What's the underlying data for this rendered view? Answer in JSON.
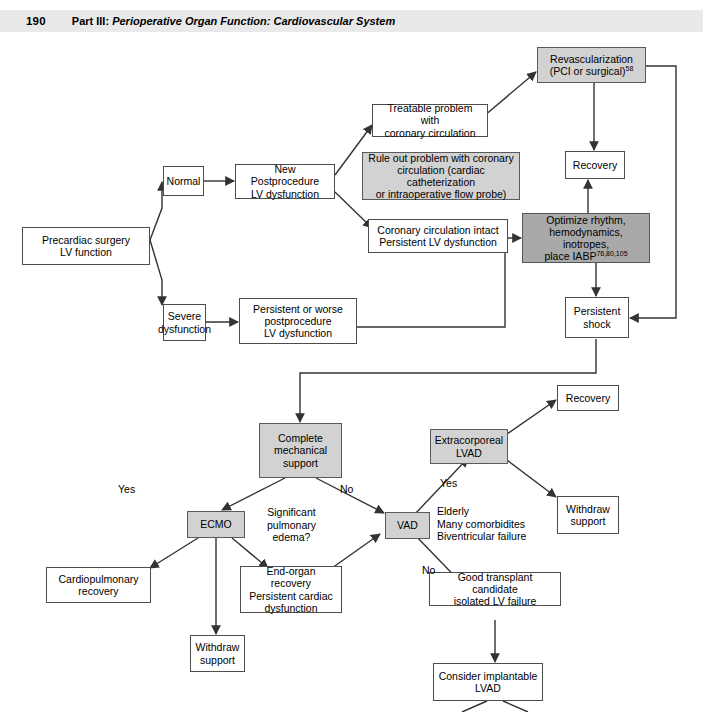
{
  "header": {
    "page_number": "190",
    "part_prefix": "Part III:",
    "part_title": "Perioperative Organ Function: Cardiovascular System"
  },
  "colors": {
    "gray_light_box": "#d2d2d2",
    "gray_dark_box": "#a9a9a9",
    "plain_box": "#ffffff",
    "line": "#333333",
    "header_band": "#e9e9e9"
  },
  "nodes": {
    "precardiac": "Precardiac surgery\nLV function",
    "normal": "Normal",
    "severe_dysfunction": "Severe\ndysfunction",
    "new_postprocedure": "New Postprocedure\nLV dysfunction",
    "treatable_problem": "Treatable problem with\ncoronary circulation",
    "rule_out": "Rule out problem with coronary\ncirculation (cardiac catheterization\nor intraoperative flow probe)",
    "coronary_intact": "Coronary circulation intact\nPersistent LV dysfunction",
    "persistent_worse": "Persistent or worse\npostprocedure\nLV dysfunction",
    "revascularization_line1": "Revascularization",
    "revascularization_line2": "(PCI or surgical)",
    "revascularization_ref": "58",
    "recovery_top": "Recovery",
    "optimize_line1": "Optimize rhythm,",
    "optimize_line2": "hemodynamics, inotropes,",
    "optimize_line3": "place IABP",
    "optimize_ref": "76,80,105",
    "persistent_shock": "Persistent\nshock",
    "complete_mechanical": "Complete\nmechanical\nsupport",
    "ecmo": "ECMO",
    "vad": "VAD",
    "cardiopulmonary_recovery": "Cardiopulmonary\nrecovery",
    "end_organ_recovery": "End-organ recovery\nPersistent cardiac\ndysfunction",
    "withdraw_support_left": "Withdraw\nsupport",
    "extracorporeal_lvad": "Extracorporeal\nLVAD",
    "recovery_right": "Recovery",
    "withdraw_support_right": "Withdraw\nsupport",
    "good_transplant": "Good transplant candidate\nisolated LV failure",
    "consider_implantable": "Consider implantable\nLVAD"
  },
  "labels": {
    "yes_ecmo": "Yes",
    "no_vad": "No",
    "yes_lvad": "Yes",
    "no_transplant": "No",
    "significant_pulmonary_edema": "Significant\npulmonary\nedema?",
    "vad_criteria": "Elderly\nMany comorbidites\nBiventricular failure"
  }
}
